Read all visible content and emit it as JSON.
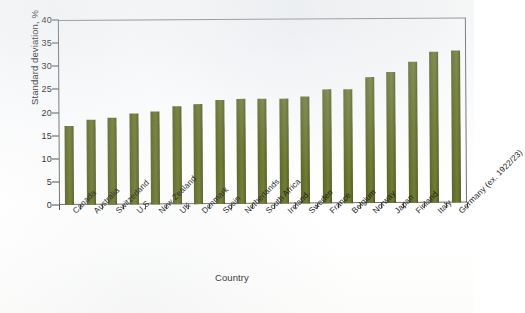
{
  "chart_data": {
    "type": "bar",
    "title": "",
    "xlabel": "Country",
    "ylabel": "Standard deviation, %",
    "ylim": [
      0,
      40
    ],
    "yticks": [
      0,
      5,
      10,
      15,
      20,
      25,
      30,
      35,
      40
    ],
    "grid": false,
    "legend": "none",
    "bar_color": "#68742c",
    "categories": [
      "Canada",
      "Australia",
      "Switzerland",
      "U.S.",
      "New Zealand",
      "UK",
      "Denmark",
      "Spain",
      "Netherlands",
      "South Africa",
      "Ireland",
      "Sweden",
      "France",
      "Belgium",
      "Norway",
      "Japan",
      "Finland",
      "Italy",
      "Germany (ex. 1922/23)"
    ],
    "values": [
      17.0,
      18.4,
      18.9,
      19.7,
      20.2,
      21.2,
      21.6,
      22.5,
      22.6,
      22.7,
      22.8,
      23.1,
      24.6,
      24.7,
      27.2,
      28.4,
      30.5,
      32.7,
      32.8
    ]
  }
}
